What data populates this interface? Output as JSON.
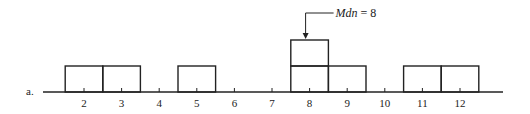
{
  "chart_data": {
    "type": "histogram",
    "panel_label": "a.",
    "title": "",
    "xlabel": "",
    "ylabel": "",
    "categories": [
      2,
      3,
      4,
      5,
      6,
      7,
      8,
      9,
      10,
      11,
      12
    ],
    "values": [
      1,
      1,
      0,
      1,
      0,
      0,
      2,
      1,
      0,
      1,
      1
    ],
    "tick_labels": [
      "2",
      "3",
      "4",
      "5",
      "6",
      "7",
      "8",
      "9",
      "10",
      "11",
      "12"
    ],
    "annotation": {
      "text_var": "Mdn",
      "text_rest": " = 8",
      "points_to": 8
    },
    "style": {
      "stroke": "#222222",
      "fill": "none",
      "grid": false,
      "legend": false
    }
  }
}
